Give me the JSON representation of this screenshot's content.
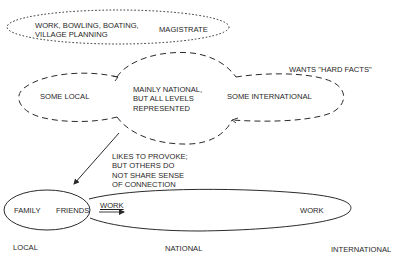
{
  "top_group": {
    "activities": "WORK, BOWLING, BOATING,\nVILLAGE PLANNING",
    "role": "MAGISTRATE"
  },
  "middle_group": {
    "left_lobe": "SOME LOCAL",
    "center_lobe": "MAINLY NATIONAL,\nBUT ALL LEVELS\nREPRESENTED",
    "right_lobe": "SOME INTERNATIONAL",
    "note": "WANTS \"HARD FACTS\""
  },
  "annotation": {
    "text": "LIKES TO PROVOKE;\nBUT OTHERS DO\nNOT SHARE SENSE\nOF CONNECTION"
  },
  "bottom_group": {
    "family": "FAMILY",
    "friends": "FRIENDS",
    "work_arrow": "WORK",
    "work_end": "WORK"
  },
  "scale_axis": {
    "local": "LOCAL",
    "national": "NATIONAL",
    "international": "INTERNATIONAL"
  },
  "colors": {
    "line": "#2a2a2a",
    "text": "#1f1f1f",
    "background": "#ffffff"
  }
}
